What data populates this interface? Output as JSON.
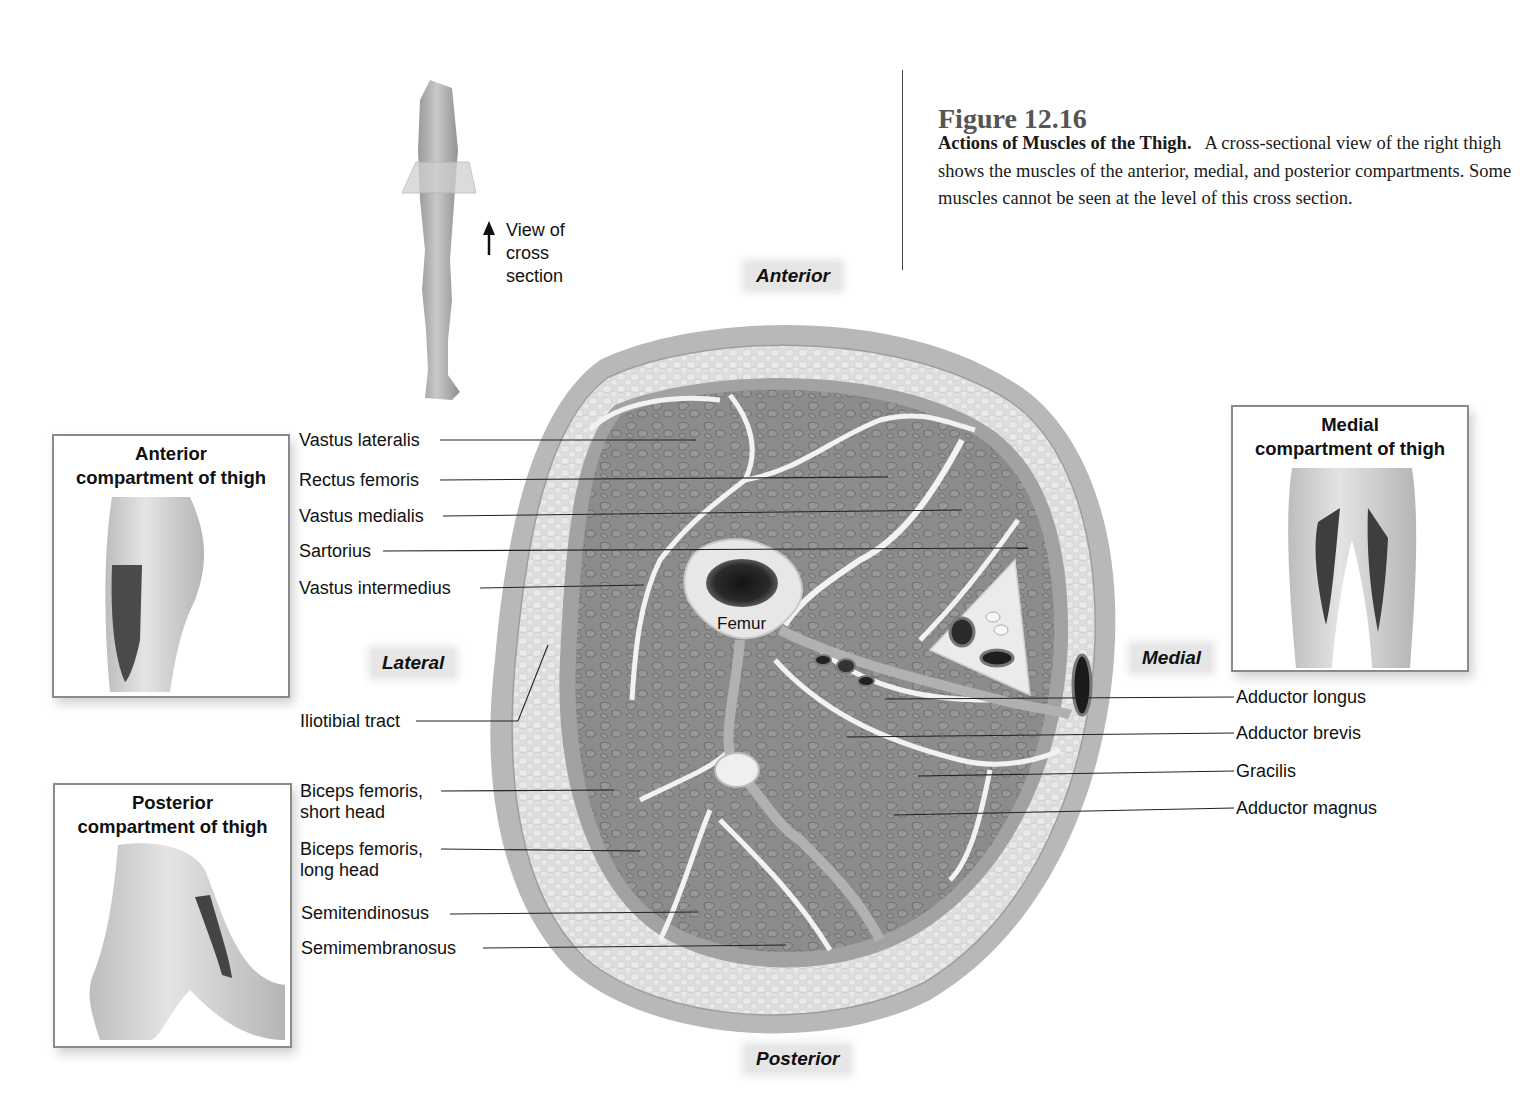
{
  "figure": {
    "number": "Figure 12.16",
    "title": "Actions of Muscles of the Thigh.",
    "caption": "A cross-sectional view of the right thigh shows the muscles of the anterior, medial, and posterior compartments. Some muscles cannot be seen at the level of this cross section."
  },
  "orientation": {
    "anterior": "Anterior",
    "posterior": "Posterior",
    "lateral": "Lateral",
    "medial": "Medial"
  },
  "view_indicator": {
    "line1": "View of",
    "line2": "cross",
    "line3": "section"
  },
  "insets": {
    "anterior": {
      "line1": "Anterior",
      "line2": "compartment of thigh"
    },
    "posterior": {
      "line1": "Posterior",
      "line2": "compartment of thigh"
    },
    "medial": {
      "line1": "Medial",
      "line2": "compartment of thigh"
    }
  },
  "bone_label": "Femur",
  "labels_left": [
    {
      "text": "Vastus lateralis"
    },
    {
      "text": "Rectus femoris"
    },
    {
      "text": "Vastus medialis"
    },
    {
      "text": "Sartorius"
    },
    {
      "text": "Vastus intermedius"
    },
    {
      "text": "Iliotibial tract"
    },
    {
      "line1": "Biceps femoris,",
      "line2": "short head"
    },
    {
      "line1": "Biceps femoris,",
      "line2": "long head"
    },
    {
      "text": "Semitendinosus"
    },
    {
      "text": "Semimembranosus"
    }
  ],
  "labels_right": [
    {
      "text": "Adductor longus"
    },
    {
      "text": "Adductor brevis"
    },
    {
      "text": "Gracilis"
    },
    {
      "text": "Adductor magnus"
    }
  ],
  "colors": {
    "muscle": "#8e8e8e",
    "fascia": "#a9a9a9",
    "fat": "#dcdcdc",
    "skin": "#bdbdbd",
    "septum": "#f2f2f2",
    "marrow": "#1e1e1e"
  }
}
